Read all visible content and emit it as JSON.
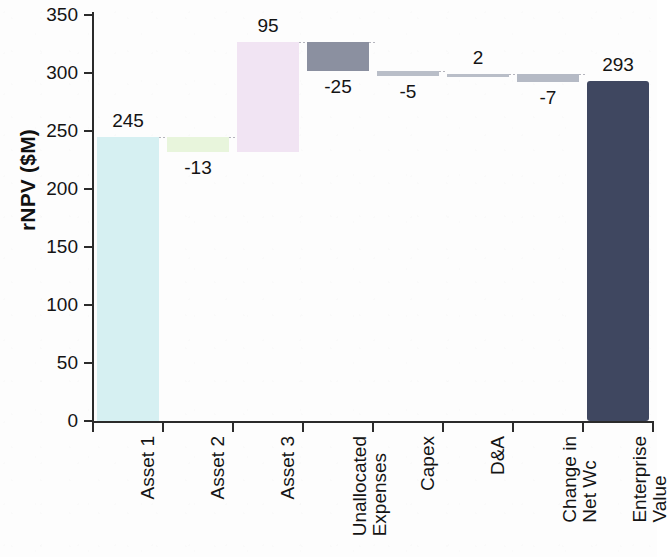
{
  "chart_data": {
    "type": "bar",
    "subtype": "waterfall",
    "title": "",
    "xlabel": "",
    "ylabel": "rNPV ($M)",
    "ylim": [
      0,
      350
    ],
    "yticks": [
      0,
      50,
      100,
      150,
      200,
      250,
      300,
      350
    ],
    "ytick_labels": [
      "0",
      "50",
      "100",
      "150",
      "200",
      "250",
      "300",
      "350"
    ],
    "grid": false,
    "legend": "none",
    "categories": [
      "Asset 1",
      "Asset 2",
      "Asset 3",
      "Unallocated Expenses",
      "Capex",
      "D&A",
      "Change in Net Wc",
      "Enterprise Value"
    ],
    "category_lines": [
      [
        "Asset 1"
      ],
      [
        "Asset 2"
      ],
      [
        "Asset 3"
      ],
      [
        "Unallocated",
        "Expenses"
      ],
      [
        "Capex"
      ],
      [
        "D&A"
      ],
      [
        "Change in",
        "Net Wc"
      ],
      [
        "Enterprise",
        "Value"
      ]
    ],
    "values": [
      245,
      -13,
      95,
      -25,
      -5,
      2,
      -7,
      293
    ],
    "data_labels": [
      "245",
      "-13",
      "95",
      "-25",
      "-5",
      "2",
      "-7",
      "293"
    ],
    "cumulative_start": [
      0,
      232,
      232,
      302,
      297,
      297,
      292,
      0
    ],
    "cumulative_end": [
      245,
      245,
      327,
      327,
      302,
      299,
      299,
      293
    ],
    "is_total": [
      false,
      false,
      false,
      false,
      false,
      false,
      false,
      true
    ],
    "bar_colors": [
      "#d6f0f2",
      "#e8f5dc",
      "#f1e4f3",
      "#8b90a0",
      "#b9bec8",
      "#b9bec8",
      "#b5bac5",
      "#3f4760"
    ],
    "axis_color": "#2b2b2b",
    "connector_color": "#787885",
    "background_color": "#fdfdfd",
    "text_color": "#141414"
  }
}
